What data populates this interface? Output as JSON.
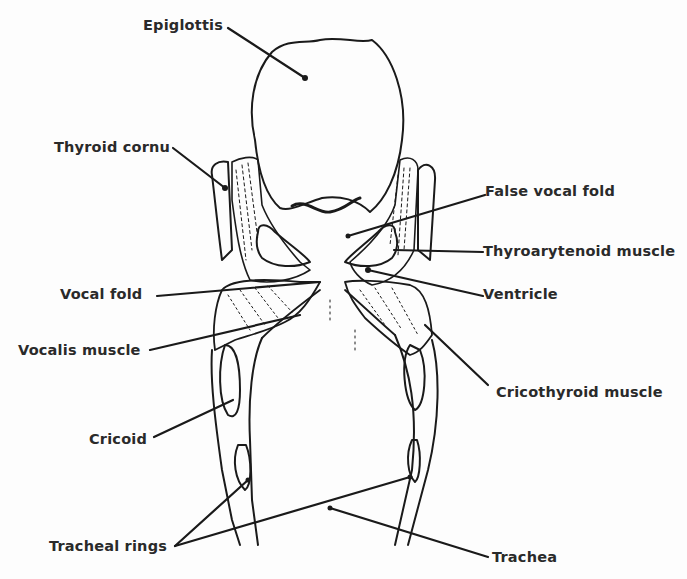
{
  "diagram": {
    "line_color": "#1a1a1a",
    "background": "#fdfdfd",
    "labels": [
      {
        "id": "epiglottis",
        "text": "Epiglottis",
        "x": 143,
        "y": 17
      },
      {
        "id": "thyroid-cornu",
        "text": "Thyroid cornu",
        "x": 54,
        "y": 139
      },
      {
        "id": "false-vocal-fold",
        "text": "False vocal fold",
        "x": 485,
        "y": 183
      },
      {
        "id": "thyroarytenoid-muscle",
        "text": "Thyroarytenoid muscle",
        "x": 483,
        "y": 243
      },
      {
        "id": "ventricle",
        "text": "Ventricle",
        "x": 483,
        "y": 286
      },
      {
        "id": "vocal-fold",
        "text": "Vocal fold",
        "x": 60,
        "y": 286
      },
      {
        "id": "vocalis-muscle",
        "text": "Vocalis muscle",
        "x": 18,
        "y": 342
      },
      {
        "id": "cricothyroid-muscle",
        "text": "Cricothyroid muscle",
        "x": 496,
        "y": 384
      },
      {
        "id": "cricoid",
        "text": "Cricoid",
        "x": 89,
        "y": 431
      },
      {
        "id": "tracheal-rings",
        "text": "Tracheal rings",
        "x": 49,
        "y": 541
      },
      {
        "id": "trachea",
        "text": "Trachea",
        "x": 492,
        "y": 549
      }
    ]
  }
}
